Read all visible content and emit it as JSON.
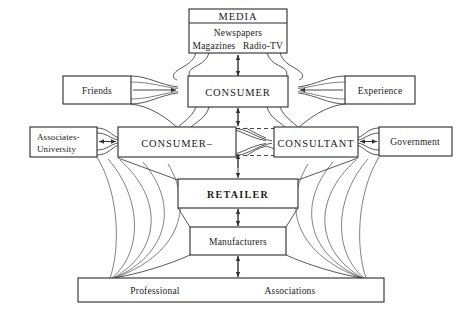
{
  "diagram": {
    "background_color": "#ffffff",
    "line_color": "#333333",
    "text_color": "#1a1a1a",
    "nodes": {
      "media": {
        "heading": "MEDIA",
        "line1": "Newspapers",
        "line2a": "Magazines",
        "line2b": "Radio-TV"
      },
      "friends": {
        "label": "Friends"
      },
      "consumer_top": {
        "label": "CONSUMER"
      },
      "experience": {
        "label": "Experience"
      },
      "associates": {
        "line1": "Associates-",
        "line2": "University"
      },
      "consumer_mid": {
        "label": "CONSUMER–"
      },
      "consultant": {
        "label": "CONSULTANT"
      },
      "government": {
        "label": "Government"
      },
      "retailer": {
        "label": "RETAILER"
      },
      "manufacturers": {
        "label": "Manufacturers"
      },
      "associations": {
        "left": "Professional",
        "right": "Associations"
      }
    }
  }
}
